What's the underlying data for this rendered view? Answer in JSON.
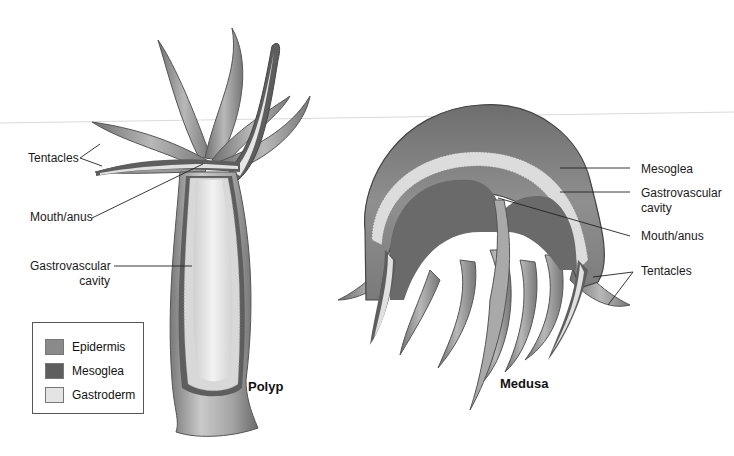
{
  "figure": {
    "polyp": {
      "title": "Polyp",
      "labels": {
        "tentacles": "Tentacles",
        "mouth_anus": "Mouth/anus",
        "gastrovascular_line1": "Gastrovascular",
        "gastrovascular_line2": "cavity"
      }
    },
    "medusa": {
      "title": "Medusa",
      "labels": {
        "mesoglea": "Mesoglea",
        "gastrovascular_line1": "Gastrovascular",
        "gastrovascular_line2": "cavity",
        "mouth_anus": "Mouth/anus",
        "tentacles": "Tentacles"
      }
    },
    "legend": {
      "items": [
        {
          "label": "Epidermis",
          "color": "#8a8a8a"
        },
        {
          "label": "Mesoglea",
          "color": "#5e5e5e"
        },
        {
          "label": "Gastroderm",
          "color": "#e4e4e4"
        }
      ]
    }
  }
}
